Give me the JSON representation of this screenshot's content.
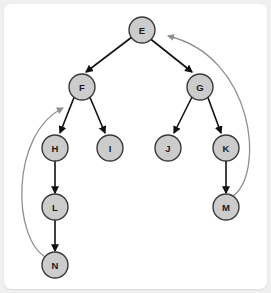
{
  "canvas": {
    "background_color": "#ffffff",
    "page_background_color": "#f0f0f0",
    "width": 271,
    "height": 293
  },
  "graph": {
    "type": "directed-graph-diagram",
    "node_style": {
      "fill_color": "#cccccc",
      "stroke_color": "#3a3a3a",
      "radius": 13
    },
    "tree_edge_color": "#111111",
    "back_edge_color": "#8f8f8f",
    "nodes": [
      {
        "id": "E",
        "label": "E",
        "x": 138,
        "y": 26
      },
      {
        "id": "F",
        "label": "F",
        "x": 78,
        "y": 83
      },
      {
        "id": "G",
        "label": "G",
        "x": 196,
        "y": 83
      },
      {
        "id": "H",
        "label": "H",
        "x": 51,
        "y": 144
      },
      {
        "id": "I",
        "label": "I",
        "x": 106,
        "y": 144
      },
      {
        "id": "J",
        "label": "J",
        "x": 164,
        "y": 144
      },
      {
        "id": "K",
        "label": "K",
        "x": 222,
        "y": 144
      },
      {
        "id": "L",
        "label": "L",
        "x": 51,
        "y": 203
      },
      {
        "id": "M",
        "label": "M",
        "x": 222,
        "y": 203
      },
      {
        "id": "N",
        "label": "N",
        "x": 51,
        "y": 261
      }
    ],
    "tree_edges": [
      {
        "from": "E",
        "to": "F"
      },
      {
        "from": "E",
        "to": "G"
      },
      {
        "from": "F",
        "to": "H"
      },
      {
        "from": "F",
        "to": "I"
      },
      {
        "from": "G",
        "to": "J"
      },
      {
        "from": "G",
        "to": "K"
      },
      {
        "from": "H",
        "to": "L"
      },
      {
        "from": "K",
        "to": "M"
      },
      {
        "from": "L",
        "to": "N"
      }
    ],
    "back_edges": [
      {
        "from": "N",
        "to": "H",
        "side": "left"
      },
      {
        "from": "M",
        "to": "E",
        "side": "right"
      }
    ]
  }
}
